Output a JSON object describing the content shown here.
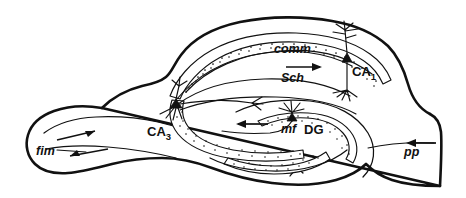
{
  "figure": {
    "background_color": "#ffffff",
    "ink_color": "#111111"
  },
  "labels": {
    "comm": "comm",
    "sch": "Sch",
    "ca1": "CA",
    "ca1_sub": "1",
    "ca3": "CA",
    "ca3_sub": "3",
    "mf": "mf",
    "dg": "DG",
    "fim": "fim",
    "pp": "pp"
  },
  "regions": [
    {
      "id": "ca1",
      "label": "CA",
      "subscript": "1",
      "style": "upright-bold",
      "x": 352,
      "y": 72
    },
    {
      "id": "ca3",
      "label": "CA",
      "subscript": "3",
      "style": "upright-bold",
      "x": 152,
      "y": 133
    },
    {
      "id": "dg",
      "label": "DG",
      "subscript": "",
      "style": "upright-bold",
      "x": 311,
      "y": 131
    }
  ],
  "pathways": [
    {
      "id": "comm",
      "label": "comm",
      "style": "italic-bold",
      "x": 274,
      "y": 53,
      "arrow": false,
      "description": "commissural fibers"
    },
    {
      "id": "sch",
      "label": "Sch",
      "style": "italic-bold",
      "x": 281,
      "y": 78,
      "arrow": true,
      "arrow_direction": "right",
      "description": "Schaffer collaterals"
    },
    {
      "id": "mf",
      "label": "mf",
      "style": "italic-bold",
      "x": 287,
      "y": 128,
      "arrow": true,
      "arrow_direction": "left",
      "description": "mossy fibers"
    },
    {
      "id": "fim",
      "label": "fim",
      "style": "italic-bold",
      "x": 40,
      "y": 151,
      "arrow": true,
      "arrow_direction": "bidirectional",
      "description": "fimbria"
    },
    {
      "id": "pp",
      "label": "pp",
      "style": "italic-bold",
      "x": 411,
      "y": 152,
      "arrow": true,
      "arrow_direction": "left",
      "description": "perforant path"
    }
  ],
  "neurons": [
    {
      "id": "ca1-pyramidal",
      "region": "CA1",
      "x": 347,
      "y": 60,
      "type": "pyramidal"
    },
    {
      "id": "ca3-pyramidal",
      "region": "CA3",
      "x": 176,
      "y": 103,
      "type": "pyramidal"
    },
    {
      "id": "dg-granule",
      "region": "DG",
      "x": 292,
      "y": 108,
      "type": "granule"
    }
  ]
}
